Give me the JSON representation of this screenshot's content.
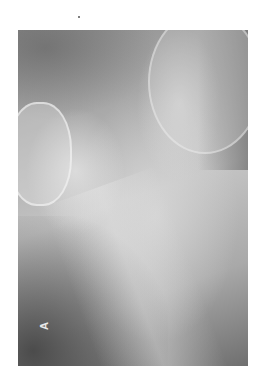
{
  "image": {
    "description": "Grayscale radiograph (X-ray) of bony anatomy, rotated",
    "panel_label": "A",
    "colors": {
      "background": "#ffffff",
      "film_dark": "#5a5a5a",
      "film_mid": "#a7a7a7",
      "film_light": "#dcdcdc",
      "label": "#e8e8e8"
    }
  }
}
